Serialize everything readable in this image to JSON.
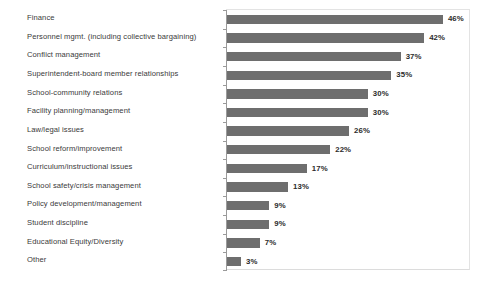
{
  "chart_data": {
    "type": "bar",
    "orientation": "horizontal",
    "title": "",
    "subtitle": "",
    "xlabel": "",
    "ylabel": "",
    "xlim": [
      0,
      49
    ],
    "grid": false,
    "legend": null,
    "value_suffix": "%",
    "bar_color": "#6e6e6e",
    "categories": [
      "Finance",
      "Personnel mgmt. (including collective bargaining)",
      "Conflict management",
      "Superintendent-board member relationships",
      "School-community relations",
      "Facility planning/management",
      "Law/legal issues",
      "School reform/improvement",
      "Curriculum/instructional issues",
      "School safety/crisis management",
      "Policy development/management",
      "Student discipline",
      "Educational Equity/Diversity",
      "Other"
    ],
    "values": [
      46,
      42,
      37,
      35,
      30,
      30,
      26,
      22,
      17,
      13,
      9,
      9,
      7,
      3
    ],
    "labels": [
      "46%",
      "42%",
      "37%",
      "35%",
      "30%",
      "30%",
      "26%",
      "22%",
      "17%",
      "13%",
      "9%",
      "9%",
      "7%",
      "3%"
    ]
  }
}
